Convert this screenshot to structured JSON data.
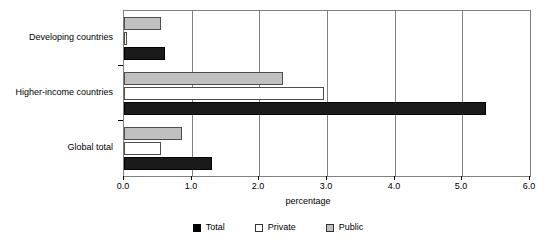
{
  "chart_data": {
    "type": "bar",
    "orientation": "horizontal",
    "title": "",
    "xlabel": "percentage",
    "ylabel": "",
    "xlim": [
      0.0,
      6.0
    ],
    "xticks": [
      "0.0",
      "1.0",
      "2.0",
      "3.0",
      "4.0",
      "5.0",
      "6.0"
    ],
    "xtick_values": [
      0.0,
      1.0,
      2.0,
      3.0,
      4.0,
      5.0,
      6.0
    ],
    "grid": true,
    "grid_axis": "x",
    "legend_position": "bottom",
    "categories": [
      "Developing countries",
      "Higher-income countries",
      "Global total"
    ],
    "series": [
      {
        "name": "Total",
        "color": "#000000",
        "values": [
          0.6,
          5.35,
          1.3
        ]
      },
      {
        "name": "Private",
        "color": "#ffffff",
        "values": [
          0.05,
          2.95,
          0.55
        ]
      },
      {
        "name": "Public",
        "color": "#c0c0c0",
        "values": [
          0.55,
          2.35,
          0.85
        ]
      }
    ],
    "series_draw_order_top_to_bottom": [
      "Public",
      "Private",
      "Total"
    ]
  },
  "axis": {
    "x_title": "percentage",
    "tick_labels": [
      "0.0",
      "1.0",
      "2.0",
      "3.0",
      "4.0",
      "5.0",
      "6.0"
    ]
  },
  "categories": [
    {
      "label": "Developing countries"
    },
    {
      "label": "Higher-income countries"
    },
    {
      "label": "Global total"
    }
  ],
  "legend": {
    "items": [
      {
        "label": "Total",
        "swatch": "black-square-icon"
      },
      {
        "label": "Private",
        "swatch": "white-square-icon"
      },
      {
        "label": "Public",
        "swatch": "gray-square-icon"
      }
    ]
  },
  "colors": {
    "total": "#000000",
    "private": "#ffffff",
    "public": "#c0c0c0",
    "grid": "#808080",
    "border": "#808080"
  }
}
